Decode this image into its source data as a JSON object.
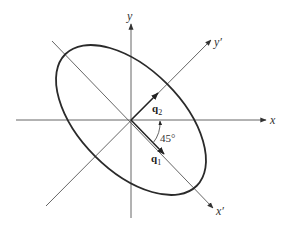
{
  "diagram": {
    "type": "rotated-ellipse-axes",
    "origin": [
      131,
      120
    ],
    "axes": {
      "x": {
        "label": "x"
      },
      "y": {
        "label": "y"
      },
      "x_prime": {
        "label": "x′"
      },
      "y_prime": {
        "label": "y′"
      }
    },
    "vectors": [
      {
        "name": "q",
        "subscript": "1",
        "direction": "along x′"
      },
      {
        "name": "q",
        "subscript": "2",
        "direction": "along y′"
      }
    ],
    "angle": {
      "label": "45°",
      "between": "x and x′"
    },
    "ellipse": {
      "rotation_deg": 45,
      "major_axis": "x′",
      "minor_axis": "y′"
    },
    "colors": {
      "ellipse": "#2a2a2a",
      "axes": "#555555",
      "background": "#ffffff"
    }
  }
}
